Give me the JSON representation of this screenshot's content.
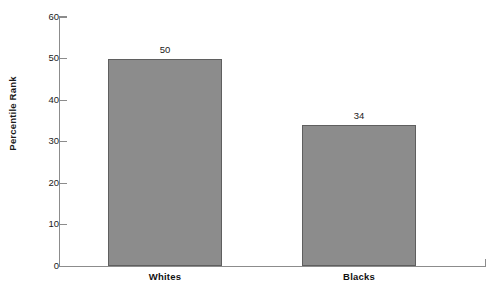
{
  "chart_data": {
    "type": "bar",
    "title": "",
    "xlabel": "",
    "ylabel": "Percentile Rank",
    "categories": [
      "Whites",
      "Blacks"
    ],
    "values": [
      50,
      34
    ],
    "value_labels": [
      "50",
      "34"
    ],
    "ylim": [
      0,
      60
    ],
    "ytick_labels": [
      "0",
      "10",
      "20",
      "30",
      "40",
      "50",
      "60"
    ],
    "ytick_values": [
      0,
      10,
      20,
      30,
      40,
      50,
      60
    ],
    "grid": false,
    "legend": null,
    "legend_position": "none",
    "bar_fill_color": "#8c8c8c",
    "bar_border_color": "#5f5f5f",
    "axis_color": "#8c8c8c",
    "text_color": "#1b1b1b"
  },
  "axes": {
    "y_title": "Percentile Rank"
  },
  "cropped_title_remnant": " "
}
